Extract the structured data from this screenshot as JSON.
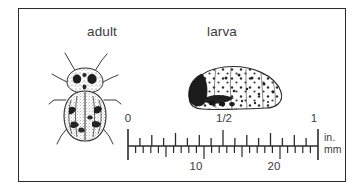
{
  "figure": {
    "background_color": "#ffffff",
    "frame_color": "#2b2b2b",
    "ink_color": "#3b3b3b"
  },
  "specimens": [
    {
      "id": "adult",
      "label": "adult",
      "illustration": "stippled-beetle-dorsal-view",
      "description": "adult beetle, dorsal view, striped elytra, spotted pronotum"
    },
    {
      "id": "larva",
      "label": "larva",
      "illustration": "stippled-grub-lateral-view",
      "description": "humpbacked larva, dark head at left, spotted body"
    }
  ],
  "scale": {
    "inches": {
      "unit_label": "in.",
      "ticks": [
        "0",
        "1/2",
        "1"
      ],
      "range": [
        0,
        1
      ],
      "subdivisions": 16,
      "tick_side": "above"
    },
    "millimeters": {
      "unit_label": "mm",
      "ticks": [
        "10",
        "20"
      ],
      "range": [
        0,
        25
      ],
      "subdivisions": 25,
      "tick_side": "below"
    }
  }
}
